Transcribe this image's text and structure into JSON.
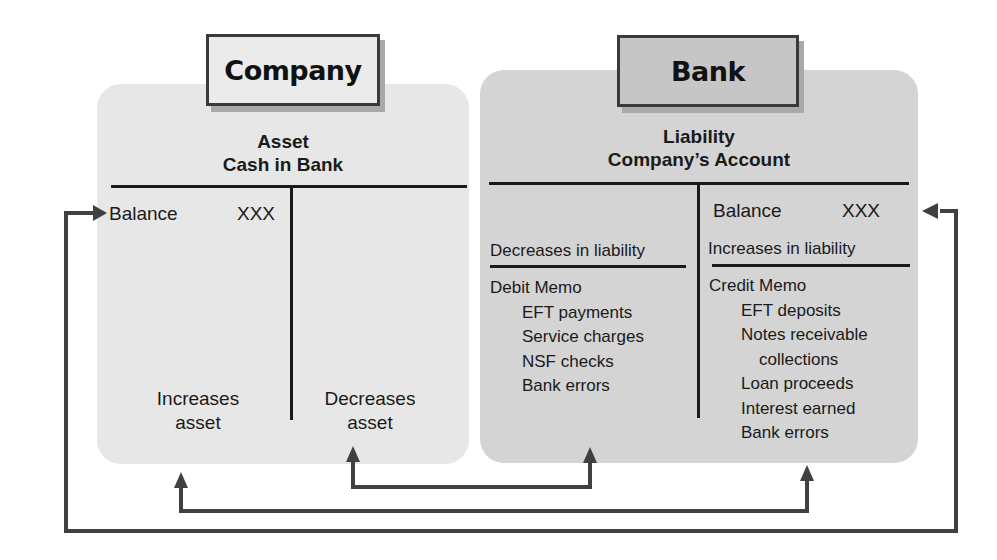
{
  "company": {
    "tag_label": "Company",
    "account_type": "Asset",
    "account_name": "Cash in Bank",
    "left_side": {
      "balance_label": "Balance",
      "balance_value": "XXX",
      "effect_line1": "Increases",
      "effect_line2": "asset"
    },
    "right_side": {
      "effect_line1": "Decreases",
      "effect_line2": "asset"
    }
  },
  "bank": {
    "tag_label": "Bank",
    "account_type": "Liability",
    "account_name": "Company’s Account",
    "left_side": {
      "effect": "Decreases in liability",
      "memo_title": "Debit Memo",
      "memo_items": [
        "EFT payments",
        "Service charges",
        "NSF checks",
        "Bank errors"
      ]
    },
    "right_side": {
      "balance_label": "Balance",
      "balance_value": "XXX",
      "effect": "Increases in liability",
      "memo_title": "Credit Memo",
      "memo_items": [
        "EFT deposits",
        "Notes receivable",
        "collections",
        "Loan proceeds",
        "Interest earned",
        "Bank errors"
      ]
    }
  },
  "arrows": [
    {
      "from": "bank-debit-memo",
      "to": "company-decreases-asset"
    },
    {
      "from": "bank-credit-memo",
      "to": "company-increases-asset"
    },
    {
      "from": "company-balance",
      "to": "bank-balance",
      "bidirectional": true
    }
  ],
  "colors": {
    "company_panel": "#e7e7e7",
    "bank_panel": "#d4d4d4",
    "company_tag": "#ebebeb",
    "bank_tag": "#c6c6c6",
    "lines": "#1a1a1a",
    "arrows": "#404040"
  }
}
